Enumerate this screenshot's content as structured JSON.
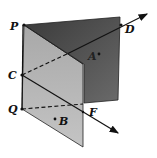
{
  "diagram": {
    "title": "",
    "colors": {
      "back_plane": "#4a4a4a",
      "front_plane": "#b4b4b4",
      "line": "#111111",
      "background": "#ffffff"
    },
    "labels": {
      "P": "P",
      "D": "D",
      "A": "A",
      "C": "C",
      "Q": "Q",
      "F": "F",
      "B": "B"
    },
    "points": {
      "P": [
        24,
        25
      ],
      "D": [
        121,
        25
      ],
      "A": [
        99,
        54
      ],
      "C": [
        22,
        75
      ],
      "Q": [
        22,
        109
      ],
      "F": [
        83,
        112
      ],
      "B": [
        55,
        119
      ]
    },
    "elements": [
      "back half-plane (dark) bounded by edge PQ",
      "front half-plane (light) bounded by edge PQ",
      "ray from C through D (dashed behind front plane)",
      "ray from C through F (arrow)",
      "dashed segment QF"
    ]
  }
}
